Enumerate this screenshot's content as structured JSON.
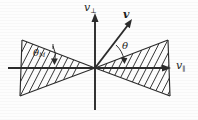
{
  "figure": {
    "kind": "velocity-space-loss-cone-diagram",
    "background_color": "#fdfdfd",
    "ink_color": "#2b2b2b",
    "axes": {
      "vertical": {
        "label": "v",
        "subscript": "⊥",
        "name": "v-perpendicular",
        "x": 95,
        "y_top": 15,
        "y_bottom": 110,
        "arrow_at": "top"
      },
      "horizontal": {
        "label": "v",
        "subscript": "∥",
        "name": "v-parallel",
        "y": 68,
        "x_left": 8,
        "x_right": 170,
        "arrow_at": "right"
      },
      "origin": {
        "x": 95,
        "y": 68
      }
    },
    "vector": {
      "label": "v",
      "name": "velocity-vector",
      "from": {
        "x": 95,
        "y": 68
      },
      "to": {
        "x": 131,
        "y": 21
      },
      "bold": true
    },
    "angles": [
      {
        "id": "theta",
        "label": "θ",
        "name": "pitch-angle-theta",
        "description": "angle between v and the loss-cone edge",
        "label_x": 122,
        "label_y": 41,
        "value_deg": 30
      },
      {
        "id": "theta-m",
        "label": "θ",
        "subscript": "M",
        "name": "loss-cone-half-angle-theta-M",
        "description": "loss cone half angle",
        "label_x": 33,
        "label_y": 48,
        "value_deg": 21
      }
    ],
    "cones": [
      {
        "id": "right-cone",
        "name": "right-loss-cone",
        "hatched": true,
        "hatch_angle_deg": 60,
        "hatch_spacing": 7,
        "apex": {
          "x": 95,
          "y": 68
        },
        "upper_edge": {
          "x": 168,
          "y": 40
        },
        "lower_edge": {
          "x": 170,
          "y": 96
        }
      },
      {
        "id": "left-cone",
        "name": "left-loss-cone",
        "hatched": true,
        "hatch_angle_deg": 60,
        "hatch_spacing": 7,
        "apex": {
          "x": 95,
          "y": 68
        },
        "upper_edge": {
          "x": 22,
          "y": 40
        },
        "lower_edge": {
          "x": 20,
          "y": 96
        }
      }
    ],
    "caption": ""
  }
}
